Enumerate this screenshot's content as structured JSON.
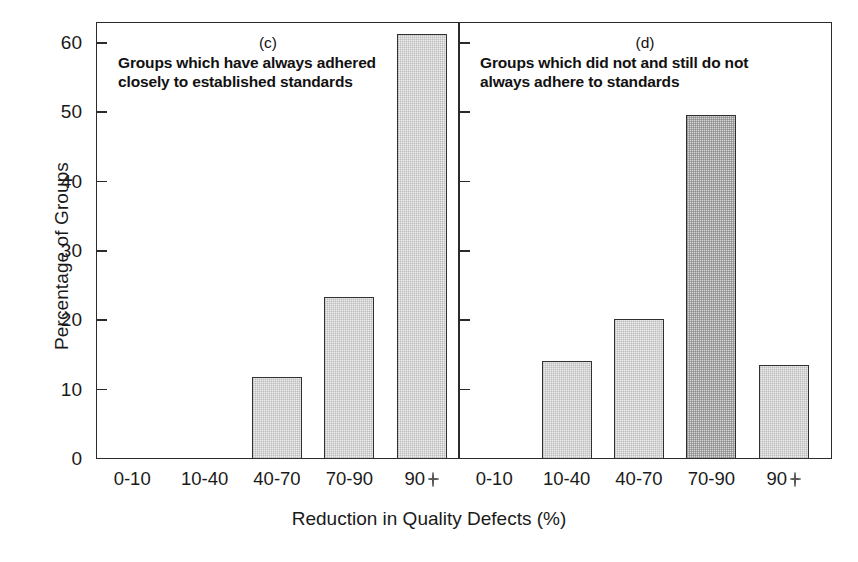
{
  "chart_data": {
    "type": "bar",
    "title": "",
    "xlabel": "Reduction in Quality Defects (%)",
    "ylabel": "Percentage of Groups",
    "categories": [
      "0-10",
      "10-40",
      "40-70",
      "70-90",
      "90+"
    ],
    "category_labels_display": [
      "0-10",
      "10-40",
      "40-70",
      "70-90",
      "90"
    ],
    "last_category_suffix": "+",
    "ylim": [
      0,
      63
    ],
    "yticks": [
      0,
      10,
      20,
      30,
      40,
      50,
      60
    ],
    "ytick_labels": [
      "0",
      "10",
      "20",
      "30",
      "40",
      "50",
      "60"
    ],
    "grid": false,
    "legend": "none",
    "panels": [
      {
        "letter": "(c)",
        "caption_line1": "Groups which have always adhered",
        "caption_line2": "closely to established standards",
        "values": [
          0,
          0,
          11.8,
          23.3,
          61.2
        ],
        "shades": [
          "light",
          "light",
          "light",
          "light",
          "light"
        ]
      },
      {
        "letter": "(d)",
        "caption_line1": "Groups which did not and still do not",
        "caption_line2": "always adhere to standards",
        "values": [
          0,
          14.1,
          20.2,
          49.6,
          13.6
        ],
        "shades": [
          "light",
          "light",
          "light",
          "dark",
          "light"
        ]
      }
    ]
  },
  "colors": {
    "axis": "#2b2b2b",
    "bar_light": "#ededed",
    "bar_dark": "#d6d6d6",
    "bar_edge": "#303030",
    "text": "#1a1a1a",
    "background": "#ffffff"
  }
}
